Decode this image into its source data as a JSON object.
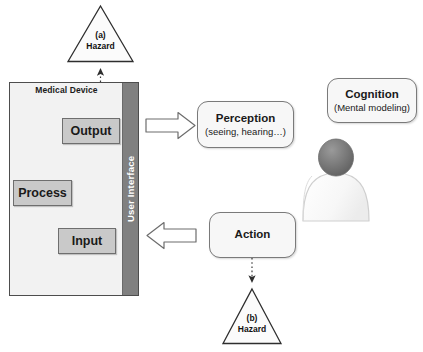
{
  "diagram": {
    "colors": {
      "grey_block_fill": "#c9c9c9",
      "grey_block_stroke": "#6e6e6e",
      "device_fill": "#f2f2f2",
      "device_stroke": "#4d4d4d",
      "ui_bar_fill": "#808080",
      "ui_bar_text": "#ffffff",
      "round_box_fill": "#f7f7f7",
      "round_box_stroke": "#7a7a7a",
      "person_head": "#6e6e6e",
      "person_body": "#fafafa",
      "arrow_stroke": "#3a3a3a",
      "background": "#ffffff"
    },
    "device": {
      "label": "Medical Device",
      "ui_bar_label": "User Interface",
      "blocks": [
        {
          "id": "output",
          "label": "Output"
        },
        {
          "id": "process",
          "label": "Process"
        },
        {
          "id": "input",
          "label": "Input"
        }
      ]
    },
    "human": {
      "perception": {
        "title": "Perception",
        "subtitle": "(seeing, hearing…)"
      },
      "cognition": {
        "title": "Cognition",
        "subtitle": "(Mental modeling)"
      },
      "action": {
        "title": "Action",
        "subtitle": ""
      },
      "figure_name": "person-silhouette"
    },
    "hazards": [
      {
        "id": "a",
        "tag": "(a)",
        "label": "Hazard"
      },
      {
        "id": "b",
        "tag": "(b)",
        "label": "Hazard"
      }
    ],
    "connectors": [
      {
        "id": "input-to-process",
        "from": "Input",
        "to": "Process",
        "style": "solid-curved-arrow"
      },
      {
        "id": "process-to-output",
        "from": "Process",
        "to": "Output",
        "style": "solid-curved-arrow"
      },
      {
        "id": "output-to-hazard-a",
        "from": "Output",
        "to": "(a) Hazard",
        "style": "dotted-arrow-up"
      },
      {
        "id": "action-to-hazard-b",
        "from": "Action",
        "to": "(b) Hazard",
        "style": "dotted-arrow-down"
      },
      {
        "id": "ui-to-perception",
        "from": "User Interface",
        "to": "Perception",
        "style": "block-arrow-right"
      },
      {
        "id": "action-to-ui",
        "from": "Action",
        "to": "User Interface",
        "style": "block-arrow-left"
      }
    ]
  }
}
